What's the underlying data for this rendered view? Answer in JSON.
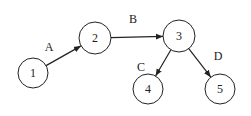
{
  "diagram": {
    "type": "directed-graph",
    "nodes": [
      {
        "id": "1",
        "label": "1",
        "cx": 33,
        "cy": 73,
        "r": 15
      },
      {
        "id": "2",
        "label": "2",
        "cx": 95,
        "cy": 38,
        "r": 16
      },
      {
        "id": "3",
        "label": "3",
        "cx": 179,
        "cy": 36,
        "r": 16
      },
      {
        "id": "4",
        "label": "4",
        "cx": 148,
        "cy": 89,
        "r": 15
      },
      {
        "id": "5",
        "label": "5",
        "cx": 220,
        "cy": 89,
        "r": 15
      }
    ],
    "edges": [
      {
        "from": "1",
        "to": "2",
        "label": "A",
        "lx": 49,
        "ly": 51
      },
      {
        "from": "2",
        "to": "3",
        "label": "B",
        "lx": 133,
        "ly": 23
      },
      {
        "from": "3",
        "to": "4",
        "label": "C",
        "lx": 141,
        "ly": 71
      },
      {
        "from": "3",
        "to": "5",
        "label": "D",
        "lx": 218,
        "ly": 60
      }
    ]
  }
}
